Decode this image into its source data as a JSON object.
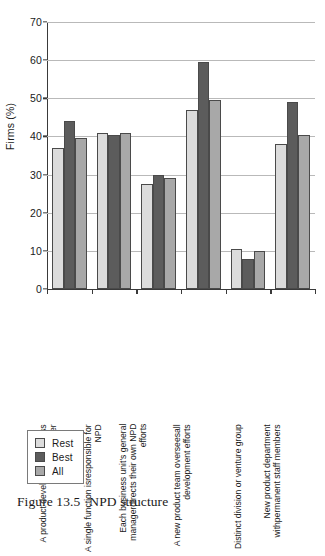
{
  "caption": {
    "label": "Figure 13.5",
    "title": "NPD structure"
  },
  "axis": {
    "y_title": "Firms (%)",
    "y_ticks": [
      "0",
      "10",
      "20",
      "30",
      "40",
      "50",
      "60",
      "70"
    ]
  },
  "legend": {
    "items": [
      {
        "key": "rest",
        "label": "Rest",
        "color": "#dcdcdc"
      },
      {
        "key": "best",
        "label": "Best",
        "color": "#5c5c5c"
      },
      {
        "key": "all",
        "label": "All",
        "color": "#a8a8a8"
      }
    ]
  },
  "chart_data": {
    "type": "bar",
    "title": "NPD structure",
    "xlabel": "",
    "ylabel": "Firms (%)",
    "ylim": [
      0,
      70
    ],
    "ytick_step": 10,
    "grid": true,
    "legend_position": "bottom-left",
    "categories": [
      "A product development process owner",
      "A single function is responsible for NPD",
      "Each business unit's general manager directs their own NPD efforts",
      "A new product team oversees all development efforts",
      "Distinct division or venture group",
      "New product department with permanent staff members"
    ],
    "category_lines": [
      [
        "A product development",
        "process owner"
      ],
      [
        "A single function is",
        "responsible for NPD"
      ],
      [
        "Each business unit's general manager",
        "directs their own NPD efforts"
      ],
      [
        "A new product team oversees",
        "all development efforts"
      ],
      [
        "Distinct division or venture group",
        ""
      ],
      [
        "New product department with",
        "permanent staff members"
      ]
    ],
    "series": [
      {
        "name": "Rest",
        "color": "#dcdcdc",
        "values": [
          37,
          41,
          27.5,
          47,
          10.5,
          38
        ]
      },
      {
        "name": "Best",
        "color": "#5c5c5c",
        "values": [
          44,
          40.5,
          30,
          59.5,
          7.8,
          49
        ]
      },
      {
        "name": "All",
        "color": "#a8a8a8",
        "values": [
          39.5,
          41,
          29,
          49.5,
          10,
          40.5
        ]
      }
    ]
  }
}
